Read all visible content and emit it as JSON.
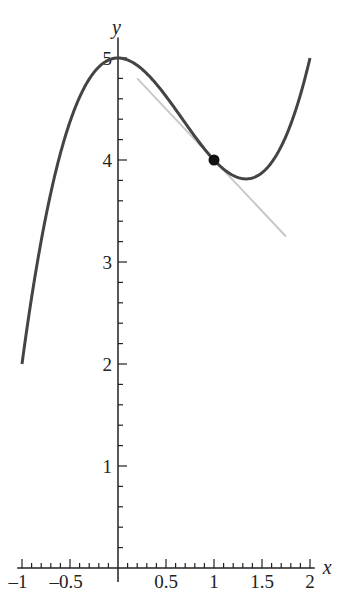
{
  "chart_data": {
    "type": "line",
    "title": "",
    "xlabel": "x",
    "ylabel": "y",
    "xlim": [
      -1,
      2
    ],
    "ylim": [
      0,
      5
    ],
    "grid": false,
    "x_ticks": [
      "-1",
      "-0.5",
      "0.5",
      "1",
      "1.5",
      "2"
    ],
    "y_ticks": [
      "1",
      "2",
      "3",
      "4",
      "5"
    ],
    "series": [
      {
        "name": "curve",
        "function": "y = x^3 - 2x^2 + 5",
        "color": "#444444",
        "x": [
          -1,
          -0.75,
          -0.5,
          -0.25,
          0,
          0.25,
          0.5,
          0.75,
          1,
          1.25,
          1.333,
          1.5,
          1.75,
          2
        ],
        "y": [
          2,
          3.457,
          4.375,
          4.859,
          5,
          4.891,
          4.625,
          4.297,
          4,
          3.828,
          3.815,
          3.875,
          4.234,
          5
        ]
      },
      {
        "name": "tangent line at x=1",
        "function": "y = -x + 5",
        "color": "#c8c8c8",
        "x": [
          0.2,
          1.75
        ],
        "y": [
          4.8,
          3.25
        ]
      }
    ],
    "points": [
      {
        "label": "point of tangency",
        "x": 1,
        "y": 4,
        "color": "#111111"
      }
    ]
  }
}
